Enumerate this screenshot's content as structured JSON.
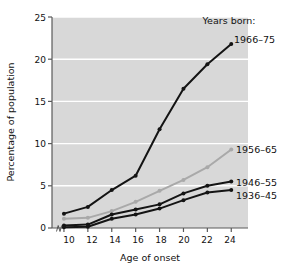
{
  "chart_data": {
    "type": "line",
    "title": "",
    "xlabel": "Age of onset",
    "ylabel": "Percentage of population",
    "legend_title": "Years born:",
    "legend_position": "inline-right",
    "grid": true,
    "grid_color": "#ffffff",
    "plot_background": "#d8d8d8",
    "x": [
      10,
      12,
      14,
      16,
      18,
      20,
      22,
      24
    ],
    "xticklabels": [
      "10",
      "12",
      "14",
      "16",
      "18",
      "20",
      "22",
      "24"
    ],
    "xlim": [
      9.0,
      25.4
    ],
    "ylim": [
      0,
      25
    ],
    "yticks": [
      0,
      5,
      10,
      15,
      20,
      25
    ],
    "yticklabels": [
      "0",
      "5",
      "10",
      "15",
      "20",
      "25"
    ],
    "axis_break": true,
    "series": [
      {
        "name": "1966–75",
        "color": "#141414",
        "values": [
          1.7,
          2.5,
          4.5,
          6.2,
          11.7,
          16.5,
          19.4,
          21.8
        ]
      },
      {
        "name": "1956–65",
        "color": "#a9a9a9",
        "values": [
          1.1,
          1.2,
          2.0,
          3.1,
          4.4,
          5.7,
          7.2,
          9.3
        ]
      },
      {
        "name": "1946–55",
        "color": "#141414",
        "values": [
          0.3,
          0.4,
          1.6,
          2.2,
          2.8,
          4.1,
          5.0,
          5.5
        ]
      },
      {
        "name": "1936–45",
        "color": "#141414",
        "values": [
          0.1,
          0.15,
          1.1,
          1.6,
          2.3,
          3.3,
          4.2,
          4.5
        ]
      }
    ]
  },
  "labels": {
    "ylabel": "Percentage of population",
    "xlabel": "Age of onset",
    "legend_title": "Years born:",
    "series_1966": "1966–75",
    "series_1956": "1956–65",
    "series_1946": "1946–55",
    "series_1936": "1936–45",
    "ytick_0": "0",
    "ytick_5": "5",
    "ytick_10": "10",
    "ytick_15": "15",
    "ytick_20": "20",
    "ytick_25": "25",
    "xtick_10": "10",
    "xtick_12": "12",
    "xtick_14": "14",
    "xtick_16": "16",
    "xtick_18": "18",
    "xtick_20": "20",
    "xtick_22": "22",
    "xtick_24": "24"
  }
}
